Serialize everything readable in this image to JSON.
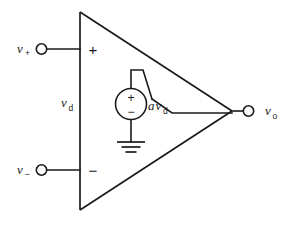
{
  "diagram": {
    "type": "circuit-schematic",
    "stroke_color": "#1a1a1a",
    "background_color": "#ffffff",
    "labels": {
      "noninverting_input": {
        "symbol": "v",
        "subscript": "+",
        "full": "v+"
      },
      "inverting_input": {
        "symbol": "v",
        "subscript": "−",
        "full": "v−"
      },
      "differential_voltage": {
        "symbol": "v",
        "subscript": "d",
        "full": "vd"
      },
      "dependent_source": {
        "gain": "a",
        "symbol": "v",
        "subscript": "d",
        "full": "avd"
      },
      "output": {
        "symbol": "v",
        "subscript": "o",
        "full": "vo"
      }
    },
    "signs": {
      "triangle_plus": "+",
      "triangle_minus": "−",
      "source_plus": "+",
      "source_minus": "−"
    },
    "components": [
      {
        "name": "amplifier-triangle",
        "kind": "op-amp-body"
      },
      {
        "name": "dependent-voltage-source",
        "kind": "vcvs",
        "value": "avd"
      },
      {
        "name": "ground-symbol",
        "kind": "ground"
      },
      {
        "name": "noninverting-input-terminal",
        "kind": "terminal"
      },
      {
        "name": "inverting-input-terminal",
        "kind": "terminal"
      },
      {
        "name": "output-terminal",
        "kind": "terminal"
      }
    ]
  }
}
